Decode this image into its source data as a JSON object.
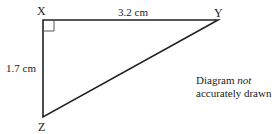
{
  "diagram": {
    "type": "right-triangle",
    "vertices": {
      "X": {
        "label": "X"
      },
      "Y": {
        "label": "Y"
      },
      "Z": {
        "label": "Z"
      }
    },
    "sides": {
      "XY": {
        "length_label": "3.2 cm"
      },
      "XZ": {
        "length_label": "1.7 cm"
      }
    },
    "right_angle_at": "X",
    "note": {
      "line1_prefix": "Diagram ",
      "line1_emphasis": "not",
      "line2": "accurately drawn"
    },
    "colors": {
      "stroke": "#222222",
      "background": "#ffffff"
    }
  }
}
